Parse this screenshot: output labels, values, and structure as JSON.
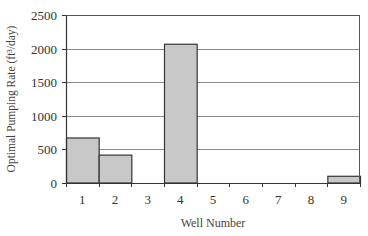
{
  "chart_data": {
    "type": "bar",
    "title": "",
    "xlabel": "Well Number",
    "ylabel": "Optimal Pumping Rate (ft³/day)",
    "categories": [
      "1",
      "2",
      "3",
      "4",
      "5",
      "6",
      "7",
      "8",
      "9"
    ],
    "values": [
      670,
      415,
      0,
      2065,
      0,
      0,
      0,
      0,
      100
    ],
    "ylim": [
      0,
      2500
    ],
    "yticks": [
      0,
      500,
      1000,
      1500,
      2000,
      2500
    ],
    "grid": true,
    "legend": null,
    "colors": {
      "bar_fill": "#c8c8c8",
      "bar_edge": "#333333",
      "grid": "#8a8a8a",
      "axis": "#333333"
    }
  }
}
